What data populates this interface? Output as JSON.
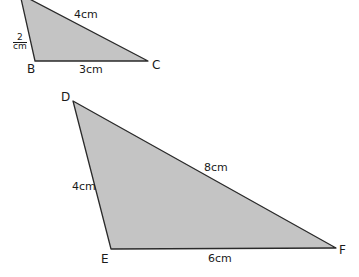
{
  "colors": {
    "fill": "#c4c4c4",
    "stroke": "#2a2a2a",
    "background": "#ffffff"
  },
  "triangle_abc": {
    "vertices": {
      "A": {
        "label": "",
        "x": 20,
        "y": -6
      },
      "B": {
        "label": "B",
        "x": 35,
        "y": 61
      },
      "C": {
        "label": "C",
        "x": 148,
        "y": 61
      }
    },
    "side_labels": {
      "ab": {
        "num": "2",
        "unit": "cm"
      },
      "ac": "4cm",
      "bc": "3cm"
    }
  },
  "triangle_def": {
    "vertices": {
      "D": {
        "label": "D",
        "x": 73,
        "y": 101
      },
      "E": {
        "label": "E",
        "x": 111,
        "y": 249
      },
      "F": {
        "label": "F",
        "x": 336,
        "y": 248
      }
    },
    "side_labels": {
      "de": "4cm",
      "df": "8cm",
      "ef": "6cm"
    }
  }
}
